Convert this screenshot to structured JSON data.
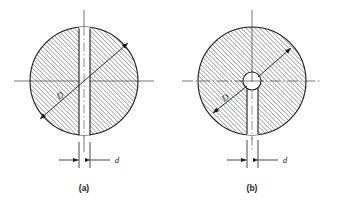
{
  "figure": {
    "type": "engineering-drawing",
    "background_color": "#ffffff",
    "line_color": "#1a1a1a",
    "hatch_color": "#333333",
    "centerline_color": "#555555",
    "panels": [
      {
        "id": "a",
        "caption": "(a)",
        "caption_x": 84,
        "caption_y": 191,
        "circle": {
          "cx": 84,
          "cy": 81,
          "r": 54
        },
        "slot": {
          "x_left": 79,
          "x_right": 90,
          "y_top": 27,
          "y_bottom": 137,
          "through": true
        },
        "diameter_label": {
          "text": "D",
          "x": 62,
          "y": 98,
          "arrow_from_x": 40,
          "arrow_from_y": 119,
          "arrow_to_x": 128,
          "arrow_to_y": 43
        },
        "width_label": {
          "text": "d",
          "x": 117,
          "y": 163,
          "dim_left_x": 79,
          "dim_right_x": 90,
          "dim_y": 160
        }
      },
      {
        "id": "b",
        "caption": "(b)",
        "caption_x": 252,
        "caption_y": 191,
        "circle": {
          "cx": 252,
          "cy": 81,
          "r": 54
        },
        "center_hole": {
          "cx": 252,
          "cy": 81,
          "r": 9
        },
        "slot": {
          "x_left": 247,
          "x_right": 258,
          "y_top": 81,
          "y_bottom": 137,
          "through": false
        },
        "diameter_label": {
          "text": "D",
          "x": 227,
          "y": 100,
          "arrow_from_x": 213,
          "arrow_from_y": 113,
          "arrow_to_x": 291,
          "arrow_to_y": 48
        },
        "width_label": {
          "text": "d",
          "x": 285,
          "y": 163,
          "dim_left_x": 247,
          "dim_right_x": 258,
          "dim_y": 160
        }
      }
    ],
    "axes": {
      "panel_a": {
        "horizontal": {
          "x1": 14,
          "y1": 81,
          "x2": 154,
          "y2": 81
        },
        "vertical": {
          "x1": 84,
          "y1": 10,
          "x2": 84,
          "y2": 152
        }
      },
      "panel_b": {
        "horizontal": {
          "x1": 182,
          "y1": 81,
          "x2": 322,
          "y2": 81
        },
        "vertical": {
          "x1": 252,
          "y1": 10,
          "x2": 252,
          "y2": 152
        }
      }
    },
    "hatching": {
      "angle_degrees": 45,
      "spacing_px": 3.2,
      "stroke_width": 0.7
    }
  }
}
